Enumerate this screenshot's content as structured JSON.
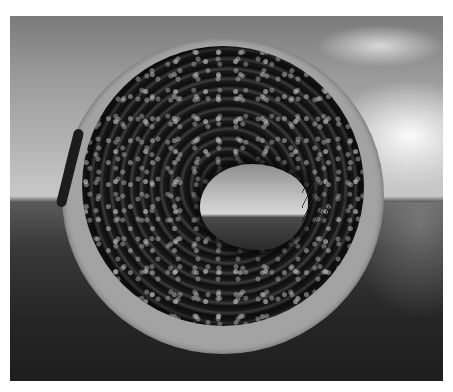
{
  "image": {
    "description": "Grayscale 3D render of a dark bumpy torus-shaped object inside a lighter circular rim, set against a cloudy sky and dark sea horizon",
    "subject": "torus-object",
    "background": "sky-over-sea",
    "colors": {
      "sky_top": "#7a7a7a",
      "sky_horizon": "#c8c8c8",
      "sky_glow": "#ffffff",
      "sea": "#262626",
      "outer_rim": "#a3a3a3",
      "torus_body": "#151515",
      "hole_view": "#c9c9c9"
    }
  }
}
